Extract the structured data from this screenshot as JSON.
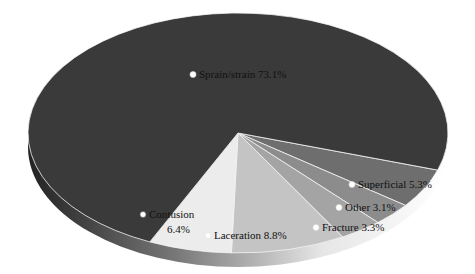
{
  "chart_data": {
    "type": "pie",
    "style": "3d-tilted",
    "title": "",
    "slices": [
      {
        "label": "Sprain/strain",
        "value": 73.1,
        "display": "Sprain/strain 73.1%",
        "color": "#3a3a3a"
      },
      {
        "label": "Contusion",
        "value": 6.4,
        "display_line1": "Contusion",
        "display_line2": "6.4%",
        "color": "#ececec"
      },
      {
        "label": "Laceration",
        "value": 8.8,
        "display": "Laceration 8.8%",
        "color": "#c4c4c4"
      },
      {
        "label": "Fracture",
        "value": 3.3,
        "display": "Fracture 3.3%",
        "color": "#a4a4a4"
      },
      {
        "label": "Other",
        "value": 3.1,
        "display": "Other 3.1%",
        "color": "#8c8c8c"
      },
      {
        "label": "Superficial",
        "value": 5.3,
        "display": "Superficial 5.3%",
        "color": "#6e6e6e"
      }
    ],
    "legend": "none (labels on slices)"
  }
}
